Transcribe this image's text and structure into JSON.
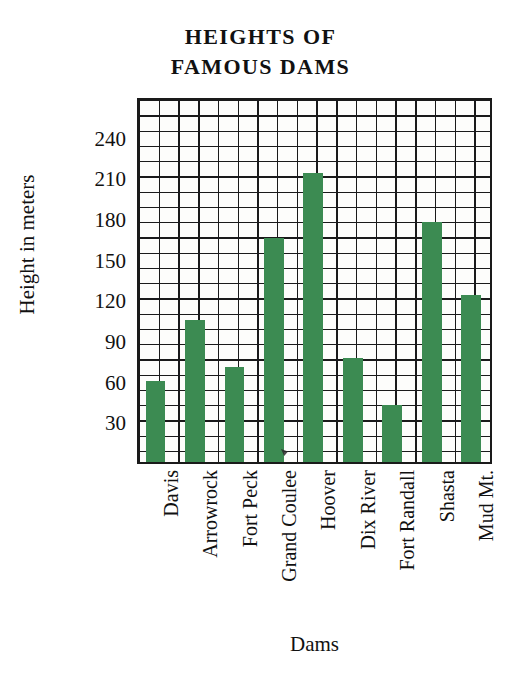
{
  "chart_data": {
    "type": "bar",
    "title": "HEIGHTS OF FAMOUS DAMS",
    "title_lines": [
      "HEIGHTS OF",
      "FAMOUS DAMS"
    ],
    "xlabel": "Dams",
    "ylabel": "Height in meters",
    "categories": [
      "Davis",
      "Arrowrock",
      "Fort Peck",
      "Grand Coulee",
      "Hoover",
      "Dix River",
      "Fort Randall",
      "Shasta",
      "Mud Mt."
    ],
    "values": [
      60,
      105,
      70,
      165,
      213,
      77,
      42,
      177,
      123
    ],
    "yticks": [
      30,
      60,
      90,
      120,
      150,
      180,
      210,
      240
    ],
    "ylim": [
      0,
      270
    ],
    "grid": true,
    "grid_step_y": 15,
    "legend": "none",
    "bar_color": "#3c8b52",
    "axis_color": "#1a1a1a",
    "plot_background": "#fdfdfb"
  }
}
